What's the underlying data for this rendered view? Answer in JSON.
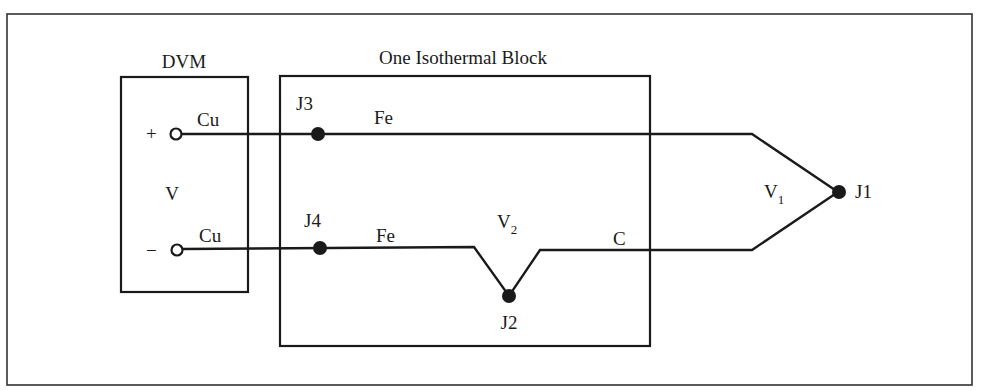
{
  "diagram": {
    "type": "thermocouple-circuit",
    "dvm": {
      "title": "DVM",
      "voltage_label": "V",
      "plus_terminal": "+",
      "minus_terminal": "−",
      "top_wire": "Cu",
      "bottom_wire": "Cu"
    },
    "isothermal_block": {
      "title": "One Isothermal Block",
      "junctions": {
        "j3": "J3",
        "j4": "J4",
        "j2": "J2"
      },
      "top_wire": "Fe",
      "bottom_wire": "Fe",
      "v2_label": "V",
      "v2_sub": "2",
      "c_wire": "C"
    },
    "external": {
      "j1": "J1",
      "v1_label": "V",
      "v1_sub": "1"
    },
    "colors": {
      "line": "#1a1a1a",
      "background": "#ffffff"
    }
  }
}
